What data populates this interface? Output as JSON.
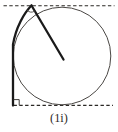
{
  "figure": {
    "caption": "(1i)",
    "colors": {
      "ink_bold": "#1a1a1a",
      "ink_thin": "#4a4744",
      "ink_dash": "#2b2825",
      "background": "#ffffff"
    }
  }
}
